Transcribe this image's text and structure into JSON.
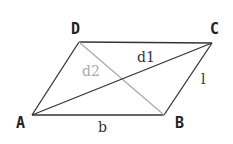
{
  "diagram": {
    "type": "parallelogram",
    "vertices": [
      {
        "id": "A",
        "label": "A",
        "x": 32,
        "y": 115,
        "label_x": 16,
        "label_y": 128
      },
      {
        "id": "B",
        "label": "B",
        "x": 164,
        "y": 115,
        "label_x": 175,
        "label_y": 128
      },
      {
        "id": "C",
        "label": "C",
        "x": 212,
        "y": 43,
        "label_x": 210,
        "label_y": 34
      },
      {
        "id": "D",
        "label": "D",
        "x": 79,
        "y": 42,
        "label_x": 71,
        "label_y": 34
      }
    ],
    "edges": [
      {
        "from": "A",
        "to": "B",
        "label": "b",
        "color": "#333333"
      },
      {
        "from": "B",
        "to": "C",
        "label": "l",
        "color": "#333333"
      },
      {
        "from": "C",
        "to": "D",
        "label": "",
        "color": "#333333"
      },
      {
        "from": "D",
        "to": "A",
        "label": "",
        "color": "#333333"
      }
    ],
    "diagonals": [
      {
        "from": "A",
        "to": "C",
        "label": "d1",
        "color": "#333333"
      },
      {
        "from": "D",
        "to": "B",
        "label": "d2",
        "color": "#aaaaaa"
      }
    ],
    "edge_labels": {
      "b": {
        "text": "b",
        "x": 98,
        "y": 132,
        "color": "#333333"
      },
      "l": {
        "text": "l",
        "x": 201,
        "y": 84,
        "color": "#333333"
      },
      "d1": {
        "text": "d1",
        "x": 137,
        "y": 62,
        "color": "#333333"
      },
      "d2": {
        "text": "d2",
        "x": 82,
        "y": 76,
        "color": "#aaaaaa"
      }
    }
  }
}
